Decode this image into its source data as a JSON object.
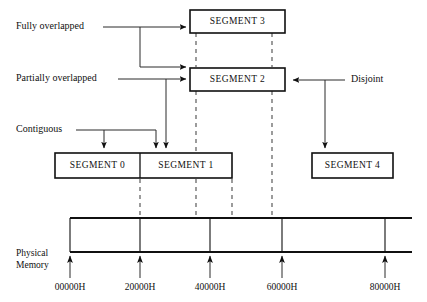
{
  "diagram": {
    "segments": [
      {
        "id": "segment-3",
        "label": "SEGMENT 3"
      },
      {
        "id": "segment-2",
        "label": "SEGMENT 2"
      },
      {
        "id": "segment-0",
        "label": "SEGMENT 0"
      },
      {
        "id": "segment-1",
        "label": "SEGMENT 1"
      },
      {
        "id": "segment-4",
        "label": "SEGMENT 4"
      }
    ],
    "annotations": [
      {
        "id": "fully-overlapped",
        "label": "Fully overlapped"
      },
      {
        "id": "partially-overlapped",
        "label": "Partially overlapped"
      },
      {
        "id": "contiguous",
        "label": "Contiguous"
      },
      {
        "id": "disjoint",
        "label": "Disjoint"
      }
    ],
    "memory_axis": {
      "label_line1": "Physical",
      "label_line2": "Memory",
      "ticks": [
        {
          "value": "00000H"
        },
        {
          "value": "20000H"
        },
        {
          "value": "40000H"
        },
        {
          "value": "60000H"
        },
        {
          "value": "80000H"
        }
      ]
    },
    "colors": {
      "background": "#ffffff",
      "stroke": "#101010",
      "connector": "#2a2a2a",
      "dashed": "#5a5a5a"
    }
  }
}
